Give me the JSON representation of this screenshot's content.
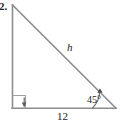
{
  "figure": {
    "problem_number": "2.",
    "hypotenuse_label": "h",
    "base_label": "12",
    "angle_label": "45°",
    "stroke_color": "#8c8c8c",
    "text_color": "#222222",
    "background_color": "#ffffff",
    "icons": {
      "right_angle_marker": "right-angle-square-icon",
      "angle_arc": "angle-arc-icon",
      "down_arrow": "down-arrow-icon",
      "arc_arrowhead": "arrow-head-icon"
    },
    "geometry": {
      "apex": [
        12,
        5
      ],
      "right_angle_vertex": [
        12,
        108
      ],
      "angle_vertex": [
        116,
        108
      ]
    }
  }
}
